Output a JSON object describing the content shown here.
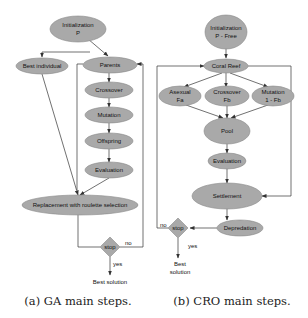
{
  "ga": {
    "caption": "(a)  GA main steps.",
    "nodes": {
      "init_line1": "Initialization",
      "init_line2": "P",
      "best_individual": "Best individual",
      "parents": "Parents",
      "crossover": "Crossover",
      "mutation": "Mutation",
      "offspring": "Offspring",
      "evaluation": "Evaluation",
      "replacement": "Replacement with roulette selection",
      "stop": "stop",
      "best_solution": "Best solution"
    },
    "labels": {
      "no": "no",
      "yes": "yes"
    }
  },
  "cro": {
    "caption": "(b)  CRO main steps.",
    "nodes": {
      "init_line1": "Initialization",
      "init_line2": "P - Free",
      "coral_reef": "Coral Reef",
      "asexual_line1": "Asexual",
      "asexual_line2": "Fa",
      "crossover_line1": "Crossover",
      "crossover_line2": "Fb",
      "mutation_line1": "Mutation",
      "mutation_line2": "1 - Fb",
      "pool": "Pool",
      "evaluation": "Evaluation",
      "settlement": "Settlement",
      "depredation": "Depredation",
      "stop": "stop",
      "best_line1": "Best",
      "best_line2": "solution"
    },
    "labels": {
      "no": "no",
      "yes": "yes"
    }
  },
  "colors": {
    "node_fill": "#a9a9a9",
    "edge": "#333333",
    "background": "#ffffff"
  }
}
